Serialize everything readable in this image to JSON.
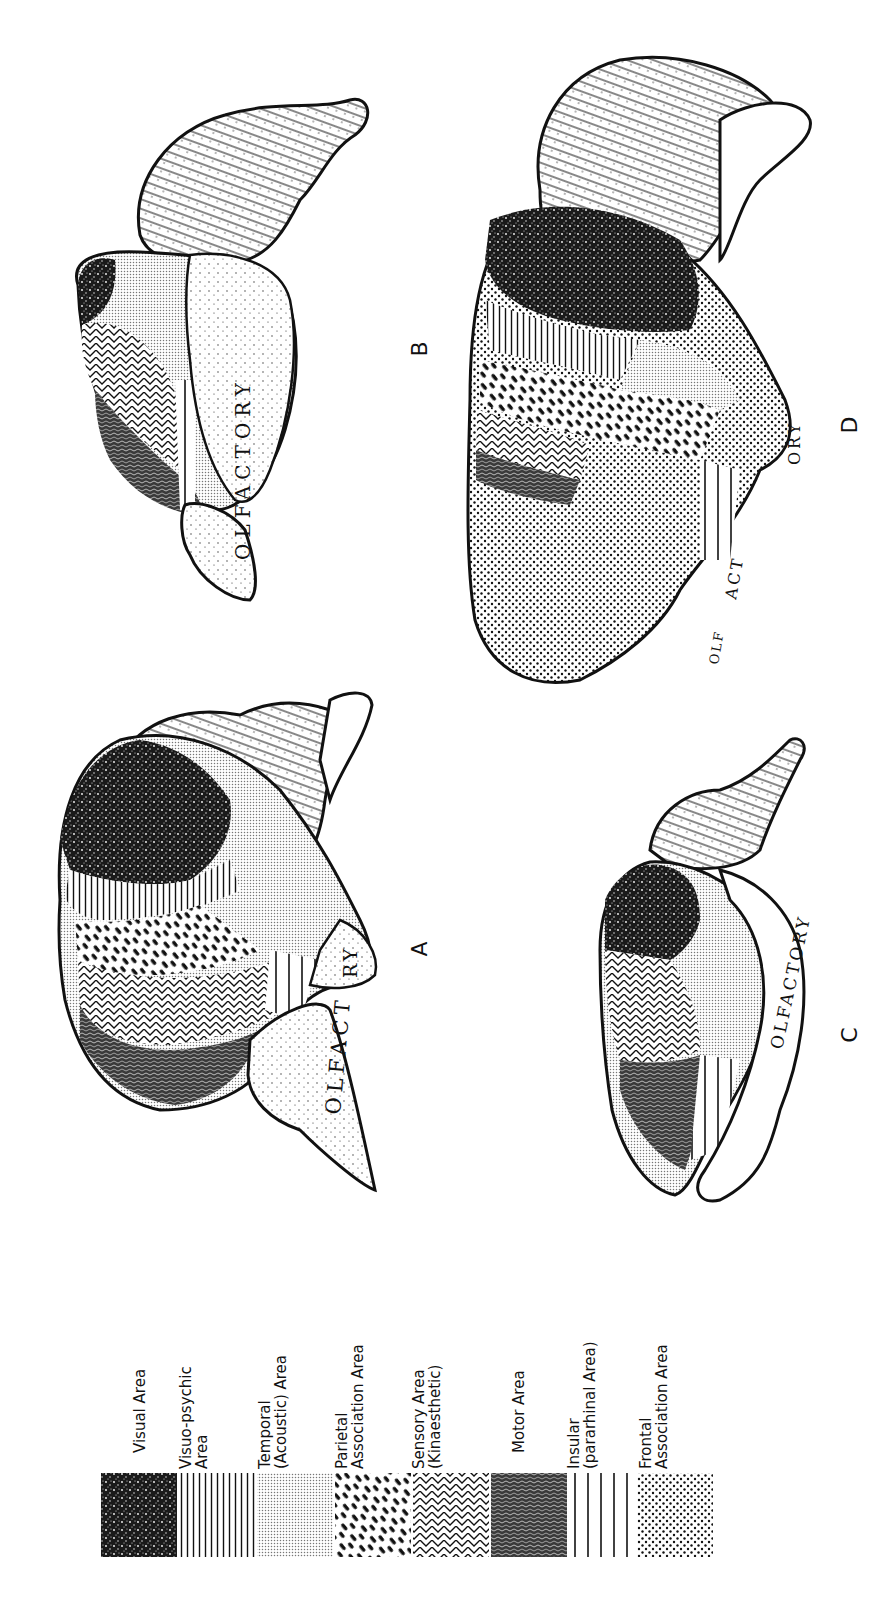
{
  "figure": {
    "panels": [
      {
        "id": "A",
        "letter": "A",
        "olfactory_label": "OLFACTORY"
      },
      {
        "id": "B",
        "letter": "B",
        "olfactory_label": "OLFACTORY"
      },
      {
        "id": "C",
        "letter": "C",
        "olfactory_label": "OLFACTORY"
      },
      {
        "id": "D",
        "letter": "D",
        "olfactory_label": "OLFACTORY"
      }
    ],
    "olfactory_fragments": {
      "a_upper": "RY",
      "a_lower": "OLFACT",
      "b_main": "OLFACTORY",
      "c_main": "OLFACTORY",
      "d_upper": "ORY",
      "d_mid": "ACT",
      "d_lower": "OLF"
    },
    "legend": {
      "items": [
        {
          "line1": "Visual Area",
          "line2": "",
          "pattern": "visual-stipple-dark"
        },
        {
          "line1": "Visuo-psychic",
          "line2": "Area",
          "pattern": "fine-vertical-lines"
        },
        {
          "line1": "Temporal",
          "line2": "(Acoustic) Area",
          "pattern": "fine-grey-dots"
        },
        {
          "line1": "Parietal",
          "line2": "Association Area",
          "pattern": "diagonal-dashes"
        },
        {
          "line1": "Sensory Area",
          "line2": "(Kinaesthetic)",
          "pattern": "chevron-zigzag"
        },
        {
          "line1": "Motor Area",
          "line2": "",
          "pattern": "vermiculate-dark"
        },
        {
          "line1": "Insular",
          "line2": "(pararhinal Area)",
          "pattern": "wide-vertical-lines"
        },
        {
          "line1": "Frontal",
          "line2": "Association Area",
          "pattern": "coarse-dots"
        }
      ]
    },
    "colors": {
      "ink": "#111111",
      "paper": "#ffffff"
    }
  }
}
